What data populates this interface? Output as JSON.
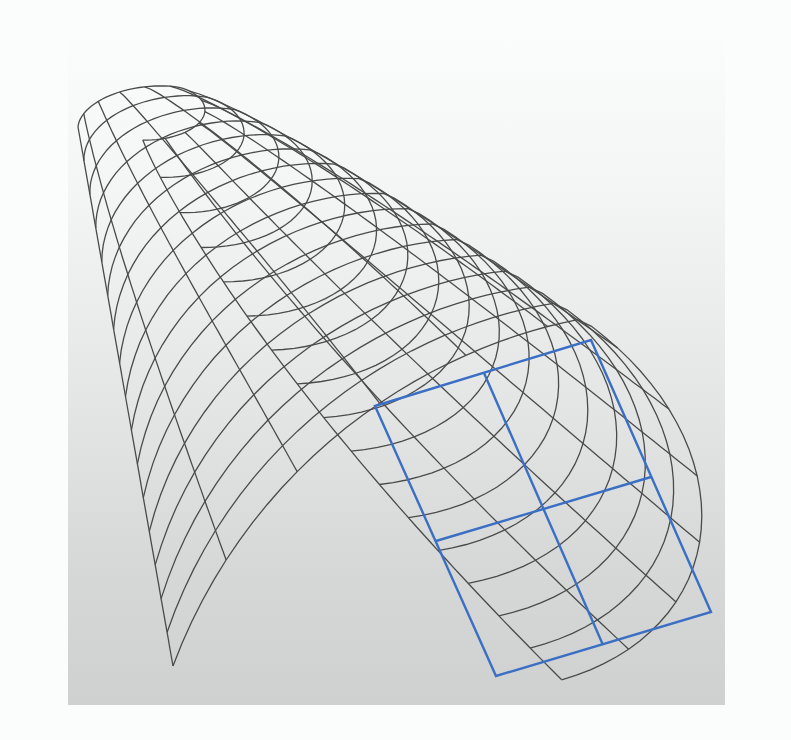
{
  "figure": {
    "colors": {
      "mesh_line": "#4a4a4a",
      "overlay_line": "#3a6fc4",
      "panel_top": "#fbfcfc",
      "panel_bottom": "#cfd1d1",
      "page_background": "#fbfdfd"
    },
    "mesh": {
      "rows": 16,
      "columns": 12,
      "left_edge": {
        "top": [
          78,
          127
        ],
        "bottom": [
          173,
          666
        ]
      },
      "bottom_edge_end": [
        496,
        690
      ],
      "cap_inner": {
        "left": [
          142,
          70
        ],
        "bend": [
          198,
          125
        ]
      },
      "silhouette": [
        [
          142,
          70
        ],
        [
          290,
          95
        ],
        [
          420,
          160
        ],
        [
          530,
          240
        ],
        [
          610,
          330
        ],
        [
          660,
          430
        ],
        [
          685,
          520
        ],
        [
          683,
          600
        ],
        [
          640,
          650
        ]
      ]
    },
    "overlay": {
      "corners": {
        "top_left": [
          375,
          406
        ],
        "top_right": [
          591,
          340
        ],
        "bottom_right": [
          711,
          612
        ],
        "bottom_left": [
          496,
          676
        ]
      },
      "divisions": {
        "vertical": [
          [
            484,
            373
          ],
          [
            603,
            645
          ]
        ],
        "horizontal": [
          [
            436,
            541
          ],
          [
            651,
            477
          ]
        ]
      }
    },
    "caption": ""
  }
}
